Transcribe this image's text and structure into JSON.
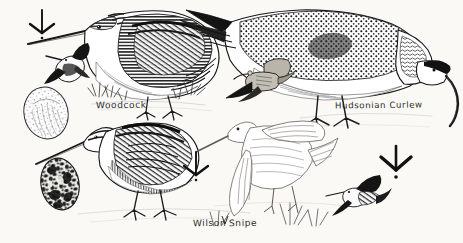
{
  "plate": {
    "medium": "pen-and-ink engraving",
    "background_color": "#faf9f6",
    "ink_color": "#1c1c1c",
    "width": 463,
    "height": 243
  },
  "labels": {
    "woodcock": "Woodcock",
    "hudsonian_curlew": "Hudsonian Curlew",
    "wilson": "Wilson",
    "snipe": "Snipe"
  },
  "subjects": [
    {
      "name": "woodcock-standing",
      "species": "Woodcock",
      "pose": "standing in profile, facing left, long straight bill angled down",
      "region": "upper-left"
    },
    {
      "name": "woodcock-flying",
      "species": "Woodcock",
      "pose": "small dark flying figure, wings down, bill forward",
      "region": "upper-left"
    },
    {
      "name": "woodcock-egg",
      "species": "Woodcock",
      "pose": "pale egg with fine speckling",
      "region": "mid-left"
    },
    {
      "name": "hudsonian-curlew-standing",
      "species": "Hudsonian Curlew",
      "pose": "standing, head lowered, long decurved bill probing down",
      "region": "upper-right"
    },
    {
      "name": "hudsonian-curlew-flying",
      "species": "Hudsonian Curlew",
      "pose": "small flying figure with decurved bill, wings spread",
      "region": "center"
    },
    {
      "name": "wilson-snipe-standing",
      "species": "Wilson Snipe",
      "pose": "standing in profile, facing left, long straight bill",
      "region": "lower-left"
    },
    {
      "name": "wilson-snipe-displaying",
      "species": "Wilson Snipe",
      "pose": "wings raised in display, lightly outlined",
      "region": "lower-center"
    },
    {
      "name": "wilson-snipe-flying",
      "species": "Wilson Snipe",
      "pose": "small dark flying figure in zigzag flight",
      "region": "lower-right"
    },
    {
      "name": "wilson-snipe-egg",
      "species": "Wilson Snipe",
      "pose": "dark heavily blotched egg",
      "region": "lower-left"
    }
  ],
  "tracks": [
    {
      "name": "track-upper-left",
      "description": "three-toed shorebird footprint with hind toe dot"
    },
    {
      "name": "track-lower-center",
      "description": "three-toed shorebird footprint with hind toe dot"
    },
    {
      "name": "track-lower-right",
      "description": "three-toed shorebird footprint with hind toe dot"
    }
  ]
}
